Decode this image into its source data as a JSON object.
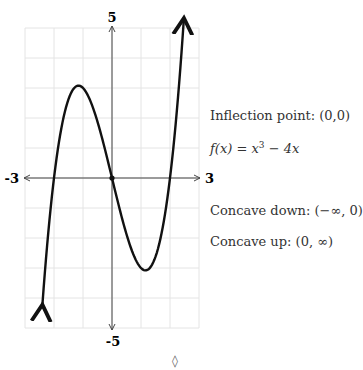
{
  "chart_data": {
    "type": "line",
    "title": "",
    "function": "f(x) = x^3 - 4x",
    "xlabel": "",
    "ylabel": "",
    "xlim": [
      -3,
      3
    ],
    "ylim": [
      -5,
      5
    ],
    "x_tick_labels": {
      "min": "-3",
      "max": "3"
    },
    "y_tick_labels": {
      "min": "-5",
      "max": "5"
    },
    "grid": true,
    "grid_step": 1,
    "series": [
      {
        "name": "f(x) = x^3 - 4x",
        "x": [
          -2.4,
          -2.2,
          -2.0,
          -1.8,
          -1.6,
          -1.4,
          -1.2,
          -1.155,
          -1.0,
          -0.8,
          -0.6,
          -0.4,
          -0.2,
          0.0,
          0.2,
          0.4,
          0.6,
          0.8,
          1.0,
          1.155,
          1.2,
          1.4,
          1.6,
          1.8,
          2.0,
          2.2,
          2.4,
          2.48
        ],
        "values": [
          -4.22,
          -1.85,
          0.0,
          1.37,
          2.3,
          2.86,
          3.07,
          3.08,
          3.0,
          2.69,
          2.18,
          1.54,
          0.79,
          0.0,
          -0.79,
          -1.54,
          -2.18,
          -2.69,
          -3.0,
          -3.08,
          -3.07,
          -2.86,
          -2.3,
          -1.37,
          0.0,
          1.85,
          4.22,
          5.33
        ]
      }
    ],
    "annotations": [
      "Inflection point: (0,0)",
      "f(x) = x³ − 4x",
      "Concave down: (−∞, 0)",
      "Concave up: (0, ∞)"
    ]
  },
  "labels": {
    "y_max": "5",
    "y_min": "-5",
    "x_min": "-3",
    "x_max": "3"
  },
  "notes": {
    "inflection": "Inflection point: (0,0)",
    "function_prefix": "f(x) = x",
    "function_exp": "3",
    "function_suffix": " − 4x",
    "concave_down": "Concave down: (−∞, 0)",
    "concave_up": "Concave up: (0, ∞)"
  },
  "footer": {
    "symbol": "◊"
  }
}
